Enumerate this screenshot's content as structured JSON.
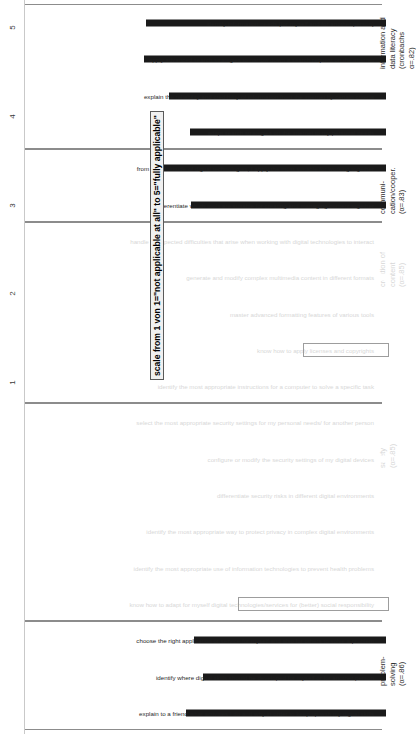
{
  "figure": {
    "scale_caption": "scale from 1 von 1=\"not applicable at all\" to 5=\"fully applicable\"",
    "axis_ticks": [
      "5",
      "4",
      "3",
      "2",
      "1"
    ]
  },
  "chart_data": {
    "type": "bar",
    "title": "",
    "subtitle": "",
    "xlabel": "",
    "ylabel": "scale from 1 von 1=\"not applicable at all\" to 5=\"fully applicable\"",
    "ylim": [
      1,
      5
    ],
    "yticks": [
      1,
      2,
      3,
      4,
      5
    ],
    "grid": false,
    "legend": "none",
    "orientation": "vertical-bars-rotated",
    "annotations": [
      "know how to apply licenses and copyrights",
      "know how to adapt for myself digital technologies/services for (better) social responsibility"
    ],
    "groups": [
      {
        "name": "information and data literacy",
        "alpha_label": "information and\ndata literacy\n(cronbachs\nα=.82)",
        "faded": false,
        "categories": [
          "identify information needs (for myself and for another person)",
          "apply advanced search strategies to narrow down a search request on the internet",
          "explain the reliability and credibility of information from the internet by certain criteria",
          "adapt search strategies on the internet to my personal needs"
        ],
        "values": [
          3.7,
          3.72,
          3.44,
          3.2
        ],
        "highlighted": []
      },
      {
        "name": "communication/cooperation",
        "alpha_label": "communi-\ncation/cooper.\n(α=.83)",
        "faded": false,
        "categories": [
          "from the multitude of digital technologies, I apply the most suitable for working together",
          "differentiate which tools are suitable for creating and managing content together"
        ],
        "values": [
          3.58,
          3.19
        ],
        "highlighted": []
      },
      {
        "name": "creation of content",
        "alpha_label": "creation of\ncontent\n(α=.85)",
        "faded": true,
        "categories": [
          "handle unexpected difficulties that arise when working with digital technologies to interact",
          "generate and modify complex multimedia content in different formats",
          "master advanced formatting features of various tools",
          "know how to apply licenses and copyrights",
          "identify the most appropriate instructions for a computer to solve a specific task"
        ],
        "values": [
          2.74,
          2.54,
          2.2,
          1.9,
          2.65
        ],
        "highlighted": [
          "know how to apply licenses and copyrights"
        ]
      },
      {
        "name": "safety",
        "alpha_label": "safety\n(α=.85)",
        "faded": true,
        "categories": [
          "select the most appropriate security settings for my personal needs/ for another person",
          "configure or modify the security settings of my digital devices",
          "differentiate security risks in different digital environments",
          "identify the most appropriate way to protect privacy in complex digital environments",
          "identify the most appropriate use of information technologies to prevent health problems",
          "know how to adapt for myself digital technologies/services for (better) social responsibility"
        ],
        "values": [
          3.56,
          3.72,
          3.16,
          2.71,
          3.3,
          2.63
        ],
        "highlighted": [
          "know how to adapt for myself digital technologies/services for (better) social responsibility"
        ]
      },
      {
        "name": "problem-solving",
        "alpha_label": "problem-\nsolving\n(α=.86)",
        "faded": false,
        "categories": [
          "choose the right application or service for myself and also for others to solve a problem",
          "identify where digital skills should be developed for myself or for another person",
          "explain to a friend what activities I do and why in order to keep up with my digital skills"
        ],
        "values": [
          3.16,
          3.06,
          3.25
        ],
        "highlighted": []
      }
    ]
  }
}
